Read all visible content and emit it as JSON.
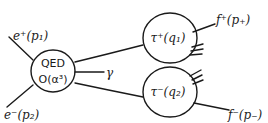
{
  "diagram": {
    "type": "feynman-process-sketch",
    "style": "hand-drawn",
    "ink_color": "#1a1a1a",
    "background": "#ffffff",
    "blobs": [
      {
        "id": "qed",
        "line1": "QED",
        "line2": "O(α³)"
      },
      {
        "id": "tau-plus",
        "label": "τ⁺(q₁)"
      },
      {
        "id": "tau-minus",
        "label": "τ⁻(q₂)"
      }
    ],
    "incoming": [
      {
        "id": "positron",
        "label": "e⁺(p₁)"
      },
      {
        "id": "electron",
        "label": "e⁻(p₂)"
      }
    ],
    "photon": {
      "label": "γ"
    },
    "outgoing": [
      {
        "id": "f-plus",
        "label": "f⁺(p₊)"
      },
      {
        "id": "f-minus",
        "label": "f⁻(p₋)"
      }
    ]
  }
}
